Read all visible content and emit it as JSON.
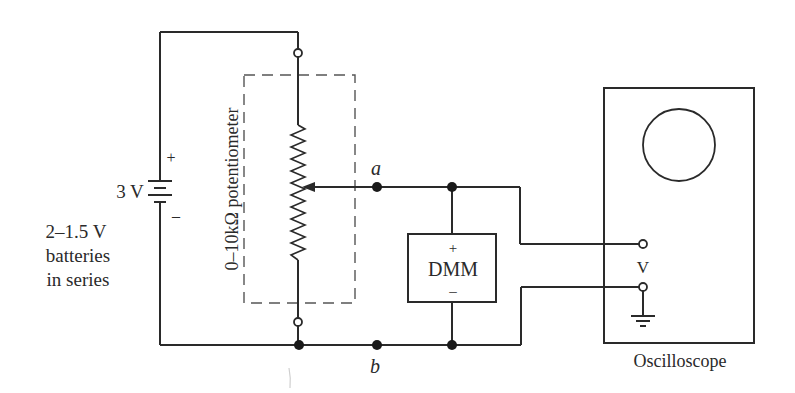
{
  "diagram": {
    "type": "circuit-schematic",
    "colors": {
      "ink": "#2a2a2a",
      "background": "#ffffff",
      "dashed_box": "#555555"
    },
    "battery": {
      "voltage_label": "3 V",
      "plus_label": "+",
      "minus_label": "–",
      "description_lines": [
        "2–1.5 V",
        "batteries",
        "in series"
      ]
    },
    "potentiometer": {
      "label": "0–10kΩ potentiometer"
    },
    "nodes": {
      "a_label": "a",
      "b_label": "b"
    },
    "dmm": {
      "label": "DMM",
      "plus_label": "+",
      "minus_label": "–"
    },
    "oscilloscope": {
      "label": "Oscilloscope",
      "input_label": "V"
    }
  }
}
